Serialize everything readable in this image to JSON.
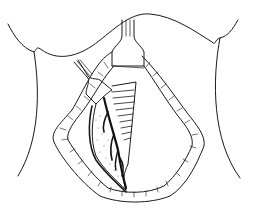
{
  "figure": {
    "type": "line-illustration",
    "colors": {
      "background": "#ffffff",
      "stroke": "#1a1a1a",
      "fill_dark": "#111111",
      "stipple": "#555555"
    }
  }
}
